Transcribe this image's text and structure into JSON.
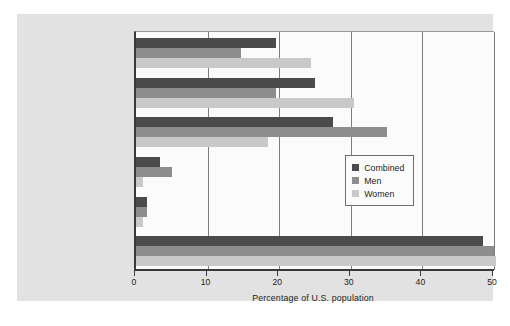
{
  "chart_data": {
    "type": "bar",
    "orientation": "horizontal",
    "title": "",
    "xlabel": "Percentage of U.S. population",
    "ylabel": "",
    "xlim": [
      0,
      50
    ],
    "xticks": [
      "0",
      "10",
      "20",
      "30",
      "40",
      "50"
    ],
    "grid": true,
    "legend_position": "center-right",
    "categories": [
      "Depression or related disorder",
      "Phobia, panic, other anxiety disorders",
      "Substance abuse disorder",
      "Antisocial personality",
      "Schizophrenia or similar disorder",
      "Any disorder"
    ],
    "series": [
      {
        "name": "Combined",
        "color": "#4b4b4b",
        "values": [
          19.5,
          25.0,
          27.5,
          3.3,
          1.5,
          48.5
        ]
      },
      {
        "name": "Men",
        "color": "#8d8d8d",
        "values": [
          14.7,
          19.5,
          35.0,
          5.0,
          1.5,
          50.0
        ]
      },
      {
        "name": "Women",
        "color": "#c9c9c9",
        "values": [
          24.5,
          30.5,
          18.5,
          1.0,
          1.0,
          50.3
        ]
      }
    ]
  },
  "axis": {
    "x_title": "Percentage of U.S. population",
    "x_ticks": [
      "0",
      "10",
      "20",
      "30",
      "40",
      "50"
    ]
  },
  "categories": [
    {
      "line1": "Depression or related",
      "line2": "disorder"
    },
    {
      "line1": "Phobia, panic, other",
      "line2": "anxiety disorders"
    },
    {
      "line1": "Substance abuse",
      "line2": "disorder"
    },
    {
      "line1": "Antisocial personality",
      "line2": ""
    },
    {
      "line1": "Schizophrenia or",
      "line2": "similar disorder"
    },
    {
      "line1": "Any disorder",
      "line2": ""
    }
  ],
  "legend": {
    "items": [
      {
        "label": "Combined",
        "color": "#4b4b4b"
      },
      {
        "label": "Men",
        "color": "#8d8d8d"
      },
      {
        "label": "Women",
        "color": "#c9c9c9"
      }
    ]
  }
}
